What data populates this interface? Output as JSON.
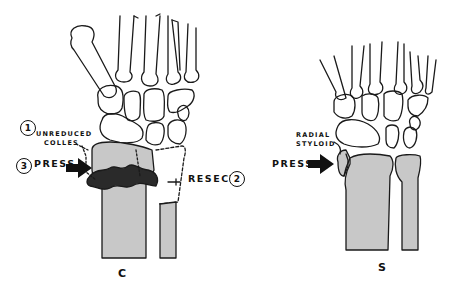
{
  "figure": {
    "left_panel": {
      "panel_label": "C",
      "callouts": [
        {
          "number": "1",
          "text_line1": "UNREDUCED",
          "text_line2": "COLLES"
        },
        {
          "number": "3",
          "text": "PRESS"
        },
        {
          "number": "2",
          "text": "RESECT"
        }
      ]
    },
    "right_panel": {
      "panel_label": "S",
      "callouts": [
        {
          "text_line1": "RADIAL",
          "text_line2": "STYLOID"
        },
        {
          "text": "PRESS"
        }
      ]
    },
    "colors": {
      "line": "#1a1a1a",
      "bone_fill": "#c8c8c8",
      "fracture_fill": "#2a2a2a",
      "background": "#ffffff"
    }
  }
}
